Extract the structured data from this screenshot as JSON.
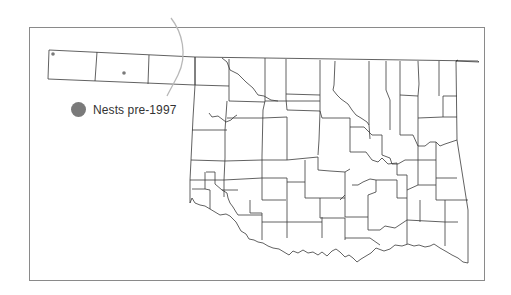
{
  "figure": {
    "type": "choropleth-outline map",
    "region": "Oklahoma counties",
    "colors": {
      "county_lines": "#3a3a3a",
      "frame": "#8a8a8a",
      "nest_dot": "#7a7a7a",
      "annotation_line": "#b8b8b8"
    }
  },
  "legend": {
    "items": [
      {
        "label": "Nests pre-1997",
        "symbol": "filled-circle",
        "color": "#7a7a7a"
      }
    ]
  },
  "markers": [
    {
      "name": "nest-1",
      "x": 53,
      "y": 54
    },
    {
      "name": "nest-2",
      "x": 124,
      "y": 73
    }
  ]
}
